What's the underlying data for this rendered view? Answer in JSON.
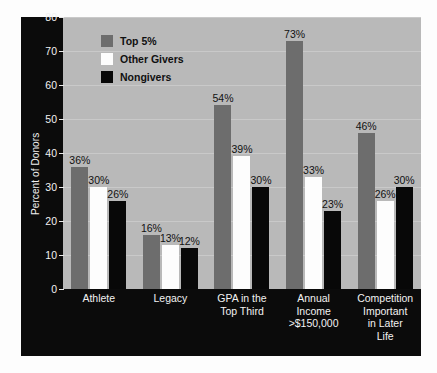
{
  "chart_data": {
    "type": "bar",
    "title": "",
    "xlabel": "",
    "ylabel": "Percent of Donors",
    "ylim": [
      0,
      80
    ],
    "ytick_values": [
      80,
      70,
      60,
      50,
      40,
      30,
      20,
      10,
      0
    ],
    "ytick_labels": [
      "80",
      "70",
      "60",
      "50",
      "40",
      "30",
      "20",
      "10",
      "0"
    ],
    "grid": true,
    "legend_position": "upper-left-inside",
    "categories": [
      "Athlete",
      "Legacy",
      "GPA in the Top Third",
      "Annual Income >$150,000",
      "Competition Important in Later Life"
    ],
    "category_lines": [
      [
        "Athlete"
      ],
      [
        "Legacy"
      ],
      [
        "GPA in the",
        "Top Third"
      ],
      [
        "Annual",
        "Income",
        ">$150,000"
      ],
      [
        "Competition",
        "Important",
        "in Later",
        "Life"
      ]
    ],
    "series": [
      {
        "name": "Top 5%",
        "color": "#6d6d6d",
        "values": [
          36,
          16,
          54,
          73,
          46
        ],
        "labels": [
          "36%",
          "16%",
          "54%",
          "73%",
          "46%"
        ]
      },
      {
        "name": "Other Givers",
        "color": "#fdfdfd",
        "values": [
          30,
          13,
          39,
          33,
          26
        ],
        "labels": [
          "30%",
          "13%",
          "39%",
          "33%",
          "26%"
        ]
      },
      {
        "name": "Nongivers",
        "color": "#080808",
        "values": [
          26,
          12,
          30,
          23,
          30
        ],
        "labels": [
          "26%",
          "12%",
          "30%",
          "23%",
          "30%"
        ]
      }
    ]
  },
  "colors": {
    "plot_background": "#b9b9b9",
    "panel_background": "#0b0b0b",
    "gridline": "#c9c9c9",
    "axis_text": "#f2f2f2",
    "value_text": "#111111"
  }
}
